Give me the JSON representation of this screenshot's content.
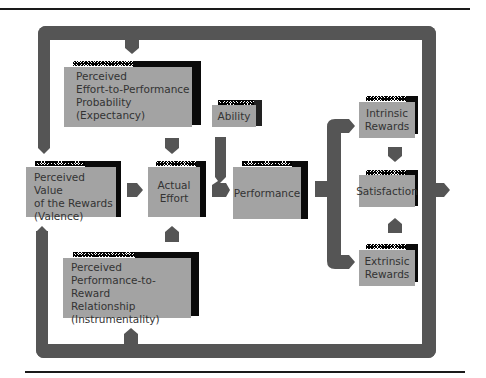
{
  "colors": {
    "loop": "#555555",
    "box_fill": "#a3a3a3",
    "box_shadow": "#0a0a0a",
    "text": "#333333",
    "rule": "#1a1a1a"
  },
  "nodes": {
    "expectancy": {
      "label": "Perceived\nEffort-to-Performance\nProbability\n(Expectancy)"
    },
    "ability": {
      "label": "Ability"
    },
    "valence": {
      "label": "Perceived Value\nof the Rewards\n(Valence)"
    },
    "effort": {
      "label": "Actual\nEffort"
    },
    "performance": {
      "label": "Performance"
    },
    "intrinsic": {
      "label": "Intrinsic\nRewards"
    },
    "satisfaction": {
      "label": "Satisfaction"
    },
    "extrinsic": {
      "label": "Extrinsic\nRewards"
    },
    "instrumentality": {
      "label": "Perceived\nPerformance-to-Reward\nRelationship\n(Instrumentality)"
    }
  },
  "edges": [
    {
      "from": "loop-top",
      "to": "expectancy"
    },
    {
      "from": "loop-top",
      "to": "valence"
    },
    {
      "from": "expectancy",
      "to": "effort"
    },
    {
      "from": "valence",
      "to": "effort"
    },
    {
      "from": "instrumentality",
      "to": "effort"
    },
    {
      "from": "ability",
      "to": "performance"
    },
    {
      "from": "effort",
      "to": "performance"
    },
    {
      "from": "performance",
      "to": "intrinsic"
    },
    {
      "from": "performance",
      "to": "extrinsic"
    },
    {
      "from": "intrinsic",
      "to": "satisfaction"
    },
    {
      "from": "extrinsic",
      "to": "satisfaction"
    },
    {
      "from": "satisfaction",
      "to": "loop-right"
    },
    {
      "from": "loop-bottom",
      "to": "valence"
    },
    {
      "from": "loop-bottom",
      "to": "instrumentality"
    }
  ]
}
